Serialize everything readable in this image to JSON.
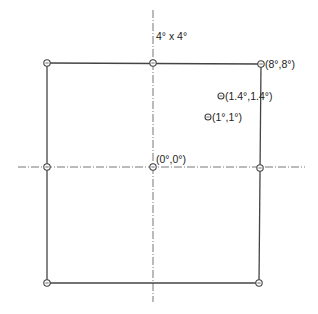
{
  "diagram": {
    "title_label": "4° x 4°",
    "colors": {
      "line": "#444444",
      "axis": "#666666",
      "marker": "#444444",
      "text": "#222222"
    },
    "square": {
      "x1": 47,
      "y1": 63,
      "x2": 261,
      "y2": 283
    },
    "axes": {
      "vertical": {
        "x": 153,
        "y1": 10,
        "y2": 302
      },
      "horizontal": {
        "y": 167,
        "x1": 18,
        "x2": 305
      }
    },
    "points": [
      {
        "id": "top-left",
        "x": 47,
        "y": 63,
        "label": ""
      },
      {
        "id": "top-middle",
        "x": 153,
        "y": 63,
        "label": ""
      },
      {
        "id": "top-right",
        "x": 261,
        "y": 64,
        "label": "(8°,8°)"
      },
      {
        "id": "middle-left",
        "x": 47,
        "y": 167,
        "label": ""
      },
      {
        "id": "center",
        "x": 153,
        "y": 167,
        "label": "(0°,0°)"
      },
      {
        "id": "middle-right",
        "x": 260,
        "y": 168,
        "label": ""
      },
      {
        "id": "bottom-left",
        "x": 47,
        "y": 283,
        "label": ""
      },
      {
        "id": "bottom-right",
        "x": 259,
        "y": 283,
        "label": ""
      },
      {
        "id": "point-1-4",
        "x": 221,
        "y": 96,
        "label": "(1.4°,1.4°)"
      },
      {
        "id": "point-1",
        "x": 208,
        "y": 117,
        "label": "(1°,1°)"
      }
    ]
  }
}
